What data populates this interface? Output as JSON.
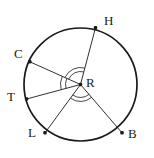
{
  "figure": {
    "background_color": "#ffffff",
    "stroke_color": "#1a1a1a",
    "label_color": "#1a1a1a",
    "width": 154,
    "height": 158
  },
  "circle": {
    "name": "circle-R",
    "center_label": "R",
    "center": {
      "x": 80.5,
      "y": 84.5
    },
    "radius": 56.5,
    "stroke_width": 1.6
  },
  "points": [
    {
      "id": "H",
      "label": "H",
      "x": 95.5,
      "y": 27.8,
      "label_x": 104,
      "label_y": 14
    },
    {
      "id": "C",
      "label": "C",
      "x": 29.8,
      "y": 61.8,
      "label_x": 14,
      "label_y": 47
    },
    {
      "id": "T",
      "label": "T",
      "x": 26.6,
      "y": 99.0,
      "label_x": 7,
      "label_y": 90
    },
    {
      "id": "L",
      "label": "L",
      "x": 45.0,
      "y": 132.8,
      "label_x": 28,
      "label_y": 126
    },
    {
      "id": "B",
      "label": "B",
      "x": 122.0,
      "y": 132.8,
      "label_x": 128,
      "label_y": 127
    }
  ],
  "center_point": {
    "id": "R",
    "label": "R",
    "x": 80.5,
    "y": 84.5,
    "label_x": 86,
    "label_y": 76
  },
  "radii": [
    {
      "name": "radius-RH",
      "from": "R",
      "to": "H"
    },
    {
      "name": "radius-RC",
      "from": "R",
      "to": "C"
    },
    {
      "name": "radius-RT",
      "from": "R",
      "to": "T"
    },
    {
      "name": "radius-RL",
      "from": "R",
      "to": "L"
    },
    {
      "name": "radius-RB",
      "from": "R",
      "to": "B"
    }
  ],
  "angle_marks": [
    {
      "name": "angle-arc-CRT-outer",
      "between": "C-T",
      "arcs": 2,
      "radius": 20
    },
    {
      "name": "angle-arc-CRT-inner",
      "between": "C-T",
      "arcs": 2,
      "radius": 15
    },
    {
      "name": "angle-arc-HRC-outer",
      "between": "H-C",
      "arcs": 2,
      "radius": 17
    },
    {
      "name": "angle-arc-HRC-inner",
      "between": "H-C",
      "arcs": 2,
      "radius": 13
    },
    {
      "name": "angle-arc-LRB-outer",
      "between": "L-B",
      "arcs": 2,
      "radius": 17
    },
    {
      "name": "angle-arc-LRB-inner",
      "between": "L-B",
      "arcs": 2,
      "radius": 13
    }
  ],
  "chart_data": {
    "type": "diagram",
    "center": "R",
    "radius_px": 56.5,
    "vertices": [
      {
        "label": "H",
        "angle_deg": 75
      },
      {
        "label": "C",
        "angle_deg": 156
      },
      {
        "label": "T",
        "angle_deg": 194
      },
      {
        "label": "L",
        "angle_deg": 238
      },
      {
        "label": "B",
        "angle_deg": 302
      }
    ],
    "segments": [
      "RH",
      "RC",
      "RT",
      "RL",
      "RB"
    ],
    "marked_angles": [
      "HRC",
      "CRT",
      "LRB"
    ]
  }
}
